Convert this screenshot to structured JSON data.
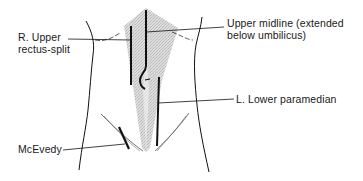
{
  "diagram": {
    "labels": {
      "r_upper_rectus_split": {
        "line1": "R. Upper",
        "line2": "rectus-split"
      },
      "upper_midline": {
        "line1": "Upper midline (extended",
        "line2": "below umbilicus)"
      },
      "l_lower_paramedian": {
        "line1": "L. Lower paramedian"
      },
      "mcevedy": {
        "line1": "McEvedy"
      }
    },
    "colors": {
      "ink": "#111111",
      "shading": "#cfcfcf",
      "background": "#ffffff"
    }
  }
}
